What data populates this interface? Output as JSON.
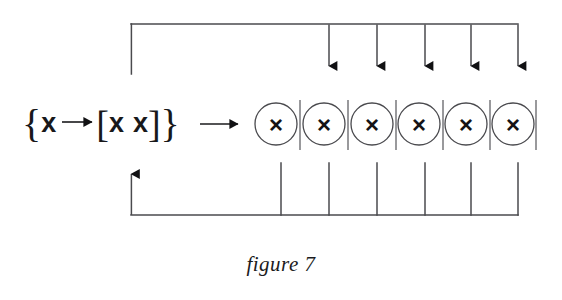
{
  "figure": {
    "caption": "figure 7",
    "background_color": "#ffffff",
    "line_color": "#4a4a4e",
    "ink_color": "#18181a"
  },
  "rule": {
    "full_text": "{x→[x x]}",
    "open_brace": "{",
    "lhs_symbol": "x",
    "production_arrow": "→",
    "open_bracket": "[",
    "rhs_symbol_1": "x",
    "rhs_symbol_2": "x",
    "close_bracket": "]",
    "close_brace": "}",
    "apply_arrow": "→"
  },
  "nodes": {
    "symbol": "×",
    "count": 6,
    "items": [
      {
        "label": "×",
        "cx": 276,
        "cy": 124,
        "r": 21
      },
      {
        "label": "×",
        "cx": 324,
        "cy": 124,
        "r": 21
      },
      {
        "label": "×",
        "cx": 372,
        "cy": 124,
        "r": 21
      },
      {
        "label": "×",
        "cx": 419,
        "cy": 124,
        "r": 21
      },
      {
        "label": "×",
        "cx": 466,
        "cy": 124,
        "r": 21
      },
      {
        "label": "×",
        "cx": 513,
        "cy": 124,
        "r": 21
      }
    ]
  },
  "dividers": {
    "x_positions": [
      300,
      348,
      396,
      443,
      490,
      536
    ],
    "y_top": 100,
    "y_bottom": 150
  },
  "top_bus": {
    "y": 24,
    "x_left": 131,
    "x_right": 518,
    "left_descender_y_end": 74,
    "arrow_x_positions": [
      329,
      377,
      425,
      471,
      518
    ],
    "arrow_tip_y": 74
  },
  "bottom_bus": {
    "y": 215,
    "x_left": 131,
    "x_right": 518,
    "left_arrow_tip_y": 166,
    "riser_x_positions": [
      281,
      329,
      377,
      425,
      471,
      518
    ],
    "riser_y_top": 163
  },
  "apply_arrow_geometry": {
    "x_start": 200,
    "x_end": 246,
    "y": 124
  }
}
